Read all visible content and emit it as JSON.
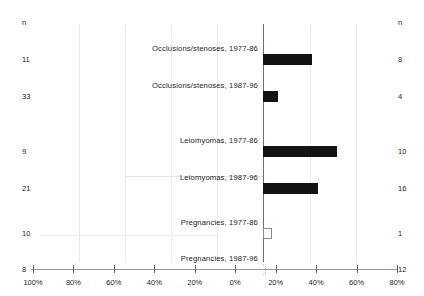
{
  "headers": {
    "left_n": "n",
    "right_n": "n"
  },
  "chart_data": {
    "type": "bar",
    "title": "",
    "subtitle": "",
    "xlabel": "",
    "ylabel": "",
    "orientation": "horizontal",
    "layout": "diverging-butterfly",
    "grid": true,
    "legend": "none",
    "axis": {
      "left_range": [
        100,
        0
      ],
      "right_range": [
        0,
        80
      ],
      "unit": "%",
      "zero_position_px": 263
    },
    "tick_labels": [
      "100%",
      "80%",
      "60%",
      "40%",
      "20%",
      "0%",
      "20%",
      "40%",
      "60%",
      "80%"
    ],
    "tick_values": [
      -100,
      -80,
      -60,
      -40,
      -20,
      0,
      20,
      40,
      60,
      80
    ],
    "tick_x_px": [
      33,
      79,
      125,
      171,
      217,
      263,
      310,
      356,
      357,
      397
    ],
    "categories": [
      "Occlusions/stenoses, 1977-86",
      "Occlusions/stenoses, 1987-96",
      "Leiomyomas, 1977-86",
      "Leiomyomas, 1987-96",
      "Pregnancies, 1977-86",
      "Pregnancies, 1987-96"
    ],
    "values": [
      29,
      9,
      44,
      33,
      4,
      1
    ],
    "n_left": [
      11,
      33,
      9,
      21,
      10,
      8
    ],
    "n_right": [
      8,
      4,
      10,
      16,
      1,
      12
    ],
    "bar_styles": [
      "solid",
      "solid",
      "solid",
      "solid",
      "hollow",
      "dotted"
    ]
  },
  "rows": [
    {
      "label": "Occlusions/stenoses, 1977-86",
      "value": 29,
      "n_left": "11",
      "n_right": "8",
      "style": "solid",
      "top": 18,
      "label_top": 2
    },
    {
      "label": "Occlusions/stenoses, 1987-96",
      "value": 9,
      "n_left": "33",
      "n_right": "4",
      "style": "solid",
      "top": 55,
      "label_top": 2
    },
    {
      "label": "Leiomyomas, 1977-86",
      "value": 44,
      "n_left": "9",
      "n_right": "10",
      "style": "solid",
      "top": 110,
      "label_top": 2
    },
    {
      "label": "Leiomyomas, 1987-96",
      "value": 33,
      "n_left": "21",
      "n_right": "16",
      "style": "solid",
      "top": 147,
      "label_top": 2
    },
    {
      "label": "Pregnancies, 1977-86",
      "value": 4,
      "n_left": "10",
      "n_right": "1",
      "style": "hollow",
      "top": 192,
      "label_top": 2
    },
    {
      "label": "Pregnancies, 1987-96",
      "value": 1,
      "n_left": "8",
      "n_right": "12",
      "style": "dotted",
      "top": 228,
      "label_top": 2
    }
  ]
}
